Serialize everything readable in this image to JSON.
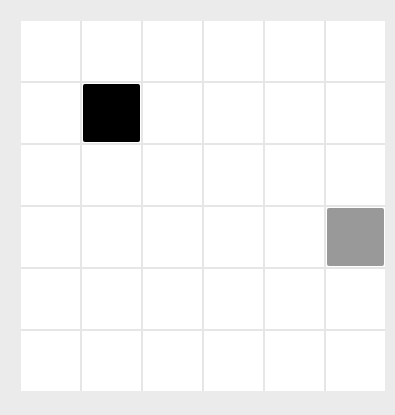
{
  "board": {
    "rows": 6,
    "cols": 6,
    "cell_color": "#ffffff",
    "pieces": [
      {
        "row": 1,
        "col": 1,
        "color": "#000000",
        "name": "black-square"
      },
      {
        "row": 3,
        "col": 5,
        "color": "#999999",
        "name": "gray-square"
      }
    ]
  }
}
